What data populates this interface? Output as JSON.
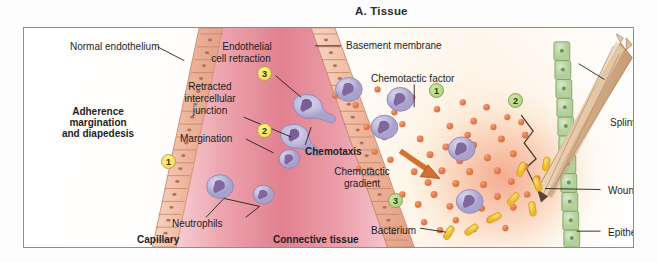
{
  "figure": {
    "title": "A. Tissue",
    "caption_left": "Adherence\nmargination\nand diapedesis"
  },
  "panel": {
    "heading_lines": [
      "Adherence",
      "margination",
      "and diapedesis"
    ],
    "zone_labels": {
      "capillary": "Capillary",
      "connective_tissue": "Connective tissue"
    }
  },
  "labels": {
    "normal_endothelium": "Normal endothelium",
    "endothelial_cell_retraction_l1": "Endothelial",
    "endothelial_cell_retraction_l2": "cell retraction",
    "basement_membrane": "Basement membrane",
    "retracted_intercellular_junction_l1": "Retracted",
    "retracted_intercellular_junction_l2": "intercellular",
    "retracted_intercellular_junction_l3": "junction",
    "margination": "Margination",
    "neutrophils": "Neutrophils",
    "chemotaxis": "Chemotaxis",
    "chemotactic_factor": "Chemotactic factor",
    "chemotactic_gradient_l1": "Chemotactic",
    "chemotactic_gradient_l2": "gradient",
    "bacterium": "Bacterium",
    "splinter": "Splinter",
    "wound": "Wound",
    "epithelium": "Epithelium"
  },
  "step_badges": {
    "inside_capillary": [
      {
        "number": "1",
        "color": "yellow",
        "meaning": "margination-step"
      },
      {
        "number": "2",
        "color": "yellow",
        "meaning": "adherence-step"
      },
      {
        "number": "3",
        "color": "yellow",
        "meaning": "diapedesis-step"
      }
    ],
    "in_tissue": [
      {
        "number": "1",
        "color": "green",
        "meaning": "chemotaxis-step"
      },
      {
        "number": "2",
        "color": "green",
        "meaning": "chemotaxis-step"
      },
      {
        "number": "3",
        "color": "green",
        "meaning": "chemotaxis-step"
      }
    ]
  },
  "colors": {
    "capillary_lumen": "#e8899a",
    "capillary_lumen_light": "#f6c3c9",
    "endothelium": "#f0b9a4",
    "neutrophil": "#c3bddd",
    "neutrophil_nucleus": "#7a5f97",
    "chemotactic_factor_dot": "#e2794a",
    "bacterium": "#f2c431",
    "epithelium": "#bcd6a8",
    "splinter": "#e0bfa0",
    "badge_yellow": "#f2da4a",
    "badge_green": "#a9ce73",
    "arrow": "#d2702f",
    "frame": "#8e8e92",
    "text": "#1e1e1e"
  }
}
